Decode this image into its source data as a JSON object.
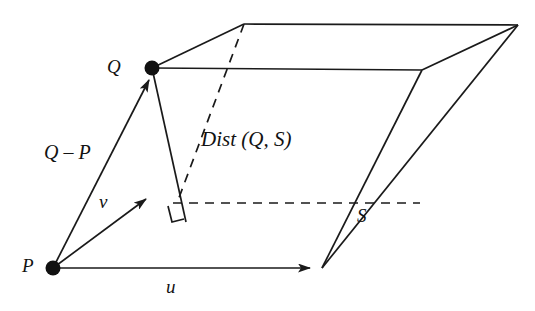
{
  "figure": {
    "background_color": "#ffffff",
    "stroke_color": "#1a1a1a",
    "labels": {
      "point_q": "Q",
      "point_p": "P",
      "vector_u": "u",
      "vector_v": "v",
      "vector_q_minus_p": "Q – P",
      "distance": "Dist (Q, S)",
      "plane_s": "S"
    },
    "points": {
      "q": {
        "x": 152,
        "y": 68
      },
      "p": {
        "x": 53,
        "y": 268
      },
      "u_tip": {
        "x": 320,
        "y": 268
      },
      "v_tip": {
        "x": 152,
        "y": 196
      },
      "foot": {
        "x": 177,
        "y": 203
      }
    },
    "plane_vertices": {
      "near_left": {
        "x": 152,
        "y": 68
      },
      "near_right": {
        "x": 422,
        "y": 70
      },
      "far_left": {
        "x": 244,
        "y": 24
      },
      "far_right": {
        "x": 518,
        "y": 25
      }
    },
    "base_vertices": {
      "left": {
        "x": 53,
        "y": 268
      },
      "right": {
        "x": 322,
        "y": 268
      },
      "dashed_left": {
        "x": 177,
        "y": 203
      },
      "dashed_right": {
        "x": 420,
        "y": 203
      }
    },
    "line_styles": {
      "solid": "solid",
      "hidden": "dashed"
    },
    "annotations": {
      "right_angle_marker": "perpendicular-foot"
    }
  }
}
